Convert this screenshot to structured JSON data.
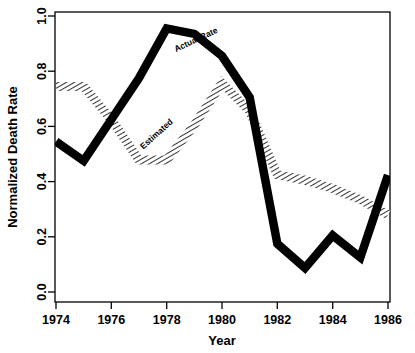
{
  "chart_data": {
    "type": "line",
    "title": "",
    "xlabel": "Year",
    "ylabel": "Normalized Death Rate",
    "xlim": [
      1974,
      1986
    ],
    "ylim": [
      0.0,
      1.0
    ],
    "grid": false,
    "legend_position": "inline-annotations",
    "x_ticks": [
      "1974",
      "1976",
      "1978",
      "1980",
      "1982",
      "1984",
      "1986"
    ],
    "x_tick_values": [
      1974,
      1976,
      1978,
      1980,
      1982,
      1984,
      1986
    ],
    "y_ticks": [
      "0.0",
      "0.2",
      "0.4",
      "0.6",
      "0.8",
      "1.0"
    ],
    "y_tick_values": [
      0.0,
      0.2,
      0.4,
      0.6,
      0.8,
      1.0
    ],
    "x": [
      1974,
      1975,
      1976,
      1977,
      1978,
      1979,
      1980,
      1981,
      1982,
      1983,
      1984,
      1985,
      1986
    ],
    "series": [
      {
        "name": "Actual Rate",
        "style": "solid-black-thick",
        "color": "#000000",
        "values": [
          0.545,
          0.475,
          0.625,
          0.775,
          0.955,
          0.935,
          0.855,
          0.705,
          0.175,
          0.087,
          0.205,
          0.125,
          0.424
        ]
      },
      {
        "name": "Estimated",
        "style": "hatched-outline",
        "color": "#000000",
        "values": [
          0.745,
          0.745,
          0.625,
          0.478,
          0.478,
          0.605,
          0.757,
          0.655,
          0.425,
          0.405,
          0.375,
          0.335,
          0.28
        ]
      }
    ],
    "annotations": [
      {
        "text": "Actual Rate",
        "x": 1979.1,
        "y": 0.905,
        "rotation": -25
      },
      {
        "text": "Estimated",
        "x": 1977.7,
        "y": 0.565,
        "rotation": -42
      }
    ]
  },
  "axes": {
    "x_title": "Year",
    "y_title": "Normalized Death Rate"
  }
}
